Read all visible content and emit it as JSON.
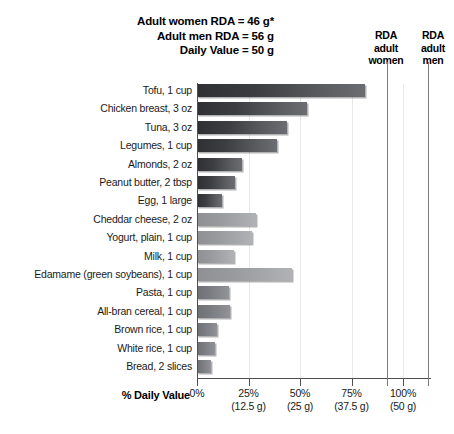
{
  "header": {
    "notes": [
      "Adult women RDA = 46 g*",
      "Adult men RDA = 56 g",
      "Daily Value = 50 g"
    ]
  },
  "markers": {
    "women": {
      "lines": [
        "RDA",
        "adult",
        "women"
      ],
      "value_pct": 92
    },
    "men": {
      "lines": [
        "RDA",
        "adult",
        "men"
      ],
      "value_pct": 112
    }
  },
  "axis": {
    "title": "% Daily Value",
    "ticks": [
      {
        "pct": "0%",
        "grams": ""
      },
      {
        "pct": "25%",
        "grams": "(12.5 g)"
      },
      {
        "pct": "50%",
        "grams": "(25 g)"
      },
      {
        "pct": "75%",
        "grams": "(37.5 g)"
      },
      {
        "pct": "100%",
        "grams": "(50 g)"
      }
    ]
  },
  "chart_data": {
    "type": "bar",
    "orientation": "horizontal",
    "title": "",
    "xlabel": "% Daily Value",
    "ylabel": "",
    "xlim": [
      0,
      100
    ],
    "grid": true,
    "legend": "none",
    "tick_values": [
      0,
      25,
      50,
      75,
      100
    ],
    "tick_labels": [
      "0%",
      "25%",
      "50%",
      "75%",
      "100%"
    ],
    "tick_sublabels": [
      "",
      "(12.5 g)",
      "(25 g)",
      "(37.5 g)",
      "(50 g)"
    ],
    "reference_lines": [
      {
        "label": "RDA adult women",
        "value": 92,
        "grams": 46
      },
      {
        "label": "RDA adult men",
        "value": 112,
        "grams": 56
      }
    ],
    "categories": [
      "Tofu, 1 cup",
      "Chicken breast, 3 oz",
      "Tuna, 3 oz",
      "Legumes, 1 cup",
      "Almonds, 2 oz",
      "Peanut butter, 2 tbsp",
      "Egg, 1 large",
      "Cheddar cheese, 2 oz",
      "Yogurt, plain, 1 cup",
      "Milk, 1 cup",
      "Edamame (green soybeans), 1 cup",
      "Pasta, 1 cup",
      "All-bran cereal, 1 cup",
      "Brown rice, 1 cup",
      "White rice, 1 cup",
      "Bread, 2 slices"
    ],
    "values": [
      81.5,
      53.5,
      43.5,
      39,
      22,
      18.5,
      12,
      28.5,
      26.5,
      18,
      46,
      15.5,
      16,
      9.5,
      8.5,
      7
    ],
    "shades": [
      "dark",
      "dark",
      "dark",
      "dark",
      "dark",
      "dark",
      "dark",
      "mid",
      "mid",
      "mid",
      "mid",
      "medium",
      "medium",
      "medium",
      "medium",
      "medium"
    ]
  },
  "colors": {
    "bar_dark": "#3c3d40",
    "bar_mid": "#a6a8ac",
    "bar_medium": "#87898e",
    "axis": "#4f4f4f",
    "reference_line": "#7a7a7a",
    "grid": "#e9e9e9",
    "text": "#1a1a1a",
    "background": "#ffffff"
  }
}
